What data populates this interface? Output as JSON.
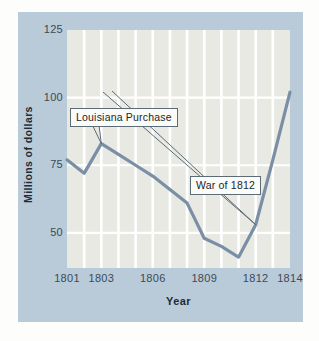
{
  "chart_data": {
    "type": "line",
    "title": "",
    "xlabel": "Year",
    "ylabel": "Millions of dollars",
    "xlim": [
      1801,
      1814
    ],
    "ylim": [
      37,
      125
    ],
    "grid": true,
    "legend": "none",
    "x": [
      1801,
      1802,
      1803,
      1804,
      1805,
      1806,
      1807,
      1808,
      1809,
      1810,
      1811,
      1812,
      1813,
      1814
    ],
    "values": [
      77,
      72,
      83,
      79,
      75,
      71,
      66,
      61,
      48,
      45,
      41,
      53,
      77,
      102
    ],
    "series": [
      {
        "name": "Millions of dollars",
        "values": [
          77,
          72,
          83,
          79,
          75,
          71,
          66,
          61,
          48,
          45,
          41,
          53,
          77,
          102
        ]
      }
    ],
    "y_ticks": [
      125,
      100,
      75,
      50
    ],
    "y_tick_labels": [
      "125",
      "100",
      "75",
      "50"
    ],
    "x_ticks": [
      1801,
      1803,
      1806,
      1809,
      1812,
      1814
    ],
    "x_tick_labels": [
      "1801",
      "1803",
      "1806",
      "1809",
      "1812",
      "1814"
    ],
    "annotations": [
      {
        "label": "Louisiana Purchase",
        "point_year": 1803,
        "point_value": 83
      },
      {
        "label": "War of 1812",
        "point_year": 1812,
        "point_value": 53
      }
    ],
    "colors": {
      "line": "#7a8fa6",
      "plot_background": "#e9e9e3",
      "panel_background": "#b9cbd9",
      "gridline": "#ffffff",
      "page_background": "#fdfdfb",
      "text": "#1e2b38",
      "callout_border": "#5b6b78",
      "callout_background": "#fbfbf7"
    }
  }
}
